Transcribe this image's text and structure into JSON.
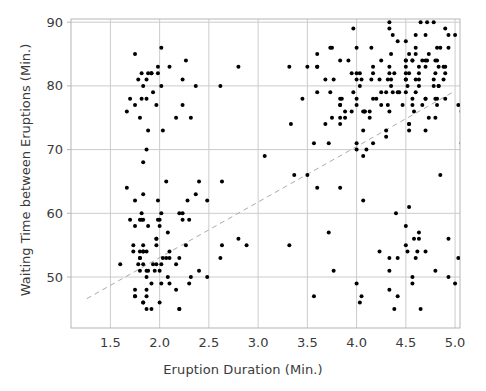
{
  "chart_data": {
    "type": "scatter",
    "title": "",
    "xlabel": "Eruption Duration (Min.)",
    "ylabel": "Waiting Time between Eruptions (Min.)",
    "xlim": [
      1.1,
      5.05
    ],
    "ylim": [
      42.0,
      90.5
    ],
    "xticks": [
      1.5,
      2.0,
      2.5,
      3.0,
      3.5,
      4.0,
      4.5,
      5.0
    ],
    "xtick_labels": [
      "1.5",
      "2.0",
      "2.5",
      "3.0",
      "3.5",
      "4.0",
      "4.5",
      "5.0"
    ],
    "yticks": [
      50,
      60,
      70,
      80,
      90
    ],
    "ytick_labels": [
      "50",
      "60",
      "70",
      "80",
      "90"
    ],
    "grid": true,
    "grid_color": "#cccccc",
    "frame_color": "#b5b5b5",
    "legend": null,
    "marker": {
      "shape": "circle",
      "color": "#000000",
      "size_px": 4
    },
    "trendline": {
      "style": "dashed",
      "color": "#aaaaaa",
      "width_px": 1,
      "x_start": 1.26,
      "y_start": 46.6,
      "x_end": 5.0,
      "y_end": 79.2
    },
    "series": [
      {
        "name": "Old Faithful eruptions",
        "points": [
          [
            3.6,
            79
          ],
          [
            1.8,
            54
          ],
          [
            3.333,
            74
          ],
          [
            2.283,
            62
          ],
          [
            4.533,
            85
          ],
          [
            2.883,
            55
          ],
          [
            4.7,
            88
          ],
          [
            3.6,
            85
          ],
          [
            1.95,
            51
          ],
          [
            4.35,
            85
          ],
          [
            1.833,
            54
          ],
          [
            3.917,
            84
          ],
          [
            4.2,
            78
          ],
          [
            1.75,
            47
          ],
          [
            4.7,
            83
          ],
          [
            2.167,
            52
          ],
          [
            1.75,
            62
          ],
          [
            4.8,
            84
          ],
          [
            1.6,
            52
          ],
          [
            4.25,
            79
          ],
          [
            1.8,
            51
          ],
          [
            1.75,
            47
          ],
          [
            3.45,
            78
          ],
          [
            3.067,
            69
          ],
          [
            4.533,
            74
          ],
          [
            3.6,
            83
          ],
          [
            1.967,
            55
          ],
          [
            4.083,
            76
          ],
          [
            3.85,
            78
          ],
          [
            4.433,
            79
          ],
          [
            4.3,
            73
          ],
          [
            4.467,
            77
          ],
          [
            3.367,
            66
          ],
          [
            4.033,
            80
          ],
          [
            3.833,
            74
          ],
          [
            2.017,
            52
          ],
          [
            1.867,
            48
          ],
          [
            4.833,
            80
          ],
          [
            1.833,
            59
          ],
          [
            4.783,
            90
          ],
          [
            4.35,
            80
          ],
          [
            1.883,
            58
          ],
          [
            4.567,
            84
          ],
          [
            1.75,
            58
          ],
          [
            4.533,
            73
          ],
          [
            3.317,
            83
          ],
          [
            3.833,
            64
          ],
          [
            2.1,
            53
          ],
          [
            4.633,
            82
          ],
          [
            2.0,
            59
          ],
          [
            4.8,
            75
          ],
          [
            4.716,
            90
          ],
          [
            1.833,
            54
          ],
          [
            4.833,
            80
          ],
          [
            1.733,
            54
          ],
          [
            4.883,
            83
          ],
          [
            3.717,
            71
          ],
          [
            1.667,
            64
          ],
          [
            4.567,
            77
          ],
          [
            4.317,
            81
          ],
          [
            2.233,
            59
          ],
          [
            4.5,
            84
          ],
          [
            1.75,
            48
          ],
          [
            4.8,
            82
          ],
          [
            1.817,
            60
          ],
          [
            4.4,
            92
          ],
          [
            4.167,
            78
          ],
          [
            4.7,
            78
          ],
          [
            2.067,
            65
          ],
          [
            4.7,
            73
          ],
          [
            4.033,
            82
          ],
          [
            1.967,
            56
          ],
          [
            4.5,
            79
          ],
          [
            4.0,
            71
          ],
          [
            1.983,
            62
          ],
          [
            5.067,
            76
          ],
          [
            2.017,
            60
          ],
          [
            4.567,
            78
          ],
          [
            3.883,
            76
          ],
          [
            3.6,
            83
          ],
          [
            4.133,
            75
          ],
          [
            4.333,
            82
          ],
          [
            4.1,
            70
          ],
          [
            2.633,
            65
          ],
          [
            4.067,
            73
          ],
          [
            4.933,
            88
          ],
          [
            3.95,
            76
          ],
          [
            4.517,
            80
          ],
          [
            2.167,
            48
          ],
          [
            4.0,
            86
          ],
          [
            2.2,
            60
          ],
          [
            4.333,
            90
          ],
          [
            1.867,
            50
          ],
          [
            4.817,
            78
          ],
          [
            1.833,
            63
          ],
          [
            4.3,
            72
          ],
          [
            4.667,
            84
          ],
          [
            3.75,
            75
          ],
          [
            1.867,
            51
          ],
          [
            4.9,
            82
          ],
          [
            2.483,
            62
          ],
          [
            4.367,
            88
          ],
          [
            2.1,
            49
          ],
          [
            4.5,
            83
          ],
          [
            4.05,
            81
          ],
          [
            1.867,
            47
          ],
          [
            4.7,
            84
          ],
          [
            1.783,
            52
          ],
          [
            4.85,
            86
          ],
          [
            3.683,
            81
          ],
          [
            4.733,
            75
          ],
          [
            2.3,
            59
          ],
          [
            4.9,
            89
          ],
          [
            4.417,
            79
          ],
          [
            1.7,
            59
          ],
          [
            4.633,
            81
          ],
          [
            2.317,
            50
          ],
          [
            4.6,
            85
          ],
          [
            1.817,
            59
          ],
          [
            4.417,
            87
          ],
          [
            2.617,
            53
          ],
          [
            4.067,
            69
          ],
          [
            4.25,
            77
          ],
          [
            1.967,
            56
          ],
          [
            4.6,
            88
          ],
          [
            3.767,
            81
          ],
          [
            1.917,
            45
          ],
          [
            4.5,
            82
          ],
          [
            2.267,
            55
          ],
          [
            4.65,
            90
          ],
          [
            1.867,
            45
          ],
          [
            4.167,
            83
          ],
          [
            2.8,
            56
          ],
          [
            4.333,
            89
          ],
          [
            1.833,
            46
          ],
          [
            4.383,
            82
          ],
          [
            1.883,
            51
          ],
          [
            4.933,
            86
          ],
          [
            2.033,
            53
          ],
          [
            3.733,
            79
          ],
          [
            4.233,
            81
          ],
          [
            2.233,
            60
          ],
          [
            4.533,
            82
          ],
          [
            4.817,
            77
          ],
          [
            4.333,
            76
          ],
          [
            1.983,
            59
          ],
          [
            4.633,
            80
          ],
          [
            2.017,
            49
          ],
          [
            5.1,
            96
          ],
          [
            1.8,
            53
          ],
          [
            5.033,
            77
          ],
          [
            4.0,
            77
          ],
          [
            2.4,
            65
          ],
          [
            4.6,
            81
          ],
          [
            3.567,
            71
          ],
          [
            4.0,
            70
          ],
          [
            4.5,
            81
          ],
          [
            4.083,
            93
          ],
          [
            1.8,
            53
          ],
          [
            3.967,
            89
          ],
          [
            2.2,
            45
          ],
          [
            4.15,
            86
          ],
          [
            2.0,
            58
          ],
          [
            3.833,
            78
          ],
          [
            3.5,
            66
          ],
          [
            4.583,
            76
          ],
          [
            2.367,
            63
          ],
          [
            5.0,
            88
          ],
          [
            1.933,
            52
          ],
          [
            4.617,
            93
          ],
          [
            1.917,
            49
          ],
          [
            2.083,
            57
          ],
          [
            3.833,
            77
          ],
          [
            1.833,
            68
          ],
          [
            4.783,
            81
          ],
          [
            4.35,
            81
          ],
          [
            1.883,
            73
          ],
          [
            4.567,
            50
          ],
          [
            1.75,
            85
          ],
          [
            4.533,
            74
          ],
          [
            3.317,
            55
          ],
          [
            3.833,
            77
          ],
          [
            2.1,
            83
          ],
          [
            4.633,
            83
          ],
          [
            2.0,
            51
          ],
          [
            4.8,
            78
          ],
          [
            4.716,
            84
          ],
          [
            1.833,
            46
          ],
          [
            4.833,
            83
          ],
          [
            1.733,
            55
          ],
          [
            4.883,
            81
          ],
          [
            3.717,
            57
          ],
          [
            1.667,
            76
          ],
          [
            4.567,
            84
          ],
          [
            4.317,
            77
          ],
          [
            2.233,
            81
          ],
          [
            4.5,
            87
          ],
          [
            1.75,
            77
          ],
          [
            4.8,
            51
          ],
          [
            1.817,
            78
          ],
          [
            4.4,
            60
          ],
          [
            4.167,
            82
          ],
          [
            4.7,
            91
          ],
          [
            2.067,
            53
          ],
          [
            4.7,
            78
          ],
          [
            4.033,
            46
          ],
          [
            1.967,
            77
          ],
          [
            4.5,
            84
          ],
          [
            4.0,
            49
          ],
          [
            1.983,
            83
          ],
          [
            5.067,
            71
          ],
          [
            2.017,
            80
          ],
          [
            4.567,
            49
          ],
          [
            3.883,
            75
          ],
          [
            3.6,
            64
          ],
          [
            4.133,
            76
          ],
          [
            4.333,
            53
          ],
          [
            4.1,
            94
          ],
          [
            2.633,
            55
          ],
          [
            4.067,
            76
          ],
          [
            4.933,
            50
          ],
          [
            3.95,
            82
          ],
          [
            4.517,
            54
          ],
          [
            2.167,
            75
          ],
          [
            4.0,
            78
          ],
          [
            2.2,
            45
          ],
          [
            4.333,
            83
          ],
          [
            1.867,
            70
          ],
          [
            4.817,
            86
          ],
          [
            1.833,
            52
          ],
          [
            4.3,
            79
          ],
          [
            4.667,
            77
          ],
          [
            3.75,
            86
          ],
          [
            1.867,
            54
          ],
          [
            4.9,
            78
          ],
          [
            2.483,
            50
          ],
          [
            4.367,
            79
          ],
          [
            2.1,
            54
          ],
          [
            4.5,
            81
          ],
          [
            4.05,
            47
          ],
          [
            1.867,
            78
          ],
          [
            4.7,
            54
          ],
          [
            1.783,
            81
          ],
          [
            4.85,
            66
          ],
          [
            3.683,
            74
          ],
          [
            4.733,
            85
          ],
          [
            2.3,
            49
          ],
          [
            4.9,
            83
          ],
          [
            4.417,
            53
          ],
          [
            1.7,
            78
          ],
          [
            4.633,
            57
          ],
          [
            2.317,
            75
          ],
          [
            4.6,
            53
          ],
          [
            1.817,
            82
          ],
          [
            4.417,
            47
          ],
          [
            2.617,
            80
          ],
          [
            4.067,
            62
          ],
          [
            4.25,
            84
          ],
          [
            1.967,
            52
          ],
          [
            4.6,
            79
          ],
          [
            3.767,
            51
          ],
          [
            1.917,
            82
          ],
          [
            4.5,
            55
          ],
          [
            2.267,
            84
          ],
          [
            4.65,
            45
          ],
          [
            1.867,
            81
          ],
          [
            4.167,
            71
          ],
          [
            2.8,
            83
          ],
          [
            4.333,
            51
          ],
          [
            1.833,
            80
          ],
          [
            4.383,
            45
          ],
          [
            1.883,
            82
          ],
          [
            4.933,
            56
          ],
          [
            2.033,
            73
          ],
          [
            3.733,
            86
          ],
          [
            4.233,
            54
          ],
          [
            2.233,
            77
          ],
          [
            4.533,
            61
          ],
          [
            4.817,
            84
          ],
          [
            4.333,
            48
          ],
          [
            1.983,
            82
          ],
          [
            4.633,
            56
          ],
          [
            2.017,
            86
          ],
          [
            5.1,
            49
          ],
          [
            1.8,
            75
          ],
          [
            5.033,
            53
          ],
          [
            4.0,
            82
          ],
          [
            2.4,
            51
          ],
          [
            4.6,
            86
          ],
          [
            3.567,
            47
          ],
          [
            4.0,
            81
          ],
          [
            4.5,
            58
          ],
          [
            4.083,
            76
          ],
          [
            1.8,
            59
          ],
          [
            3.967,
            79
          ],
          [
            2.2,
            53
          ],
          [
            4.15,
            81
          ],
          [
            2.0,
            46
          ],
          [
            3.833,
            75
          ],
          [
            3.5,
            83
          ],
          [
            4.583,
            56
          ],
          [
            2.367,
            80
          ],
          [
            5.0,
            49
          ],
          [
            1.933,
            79
          ],
          [
            4.617,
            54
          ],
          [
            1.917,
            82
          ],
          [
            2.083,
            50
          ],
          [
            3.833,
            84
          ],
          [
            1.833,
            55
          ],
          [
            4.783,
            80
          ]
        ]
      }
    ]
  }
}
